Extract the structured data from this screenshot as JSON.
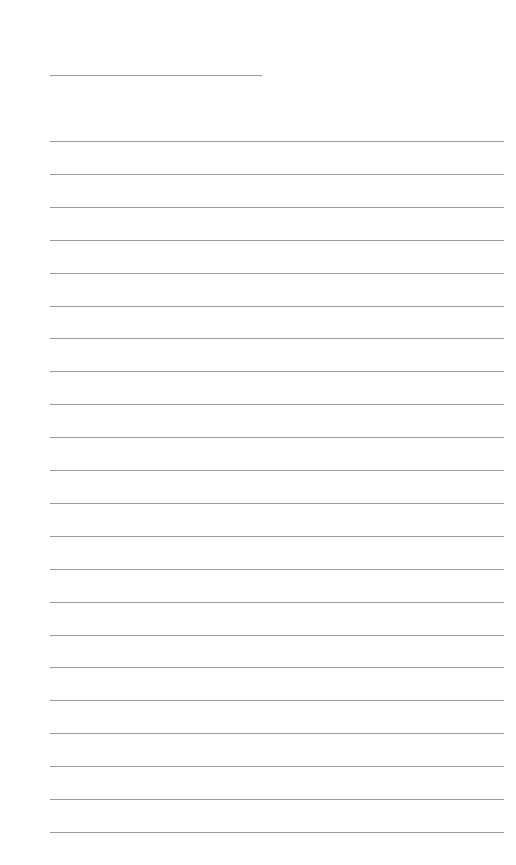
{
  "page": {
    "type": "blank-lined-paper",
    "line_color": "#9a9a9a",
    "title_line": {
      "x": 50,
      "y": 75,
      "width": 212
    },
    "rules": {
      "x": 50,
      "width": 454,
      "start_y": 141,
      "spacing": 32.9,
      "count": 22
    }
  }
}
